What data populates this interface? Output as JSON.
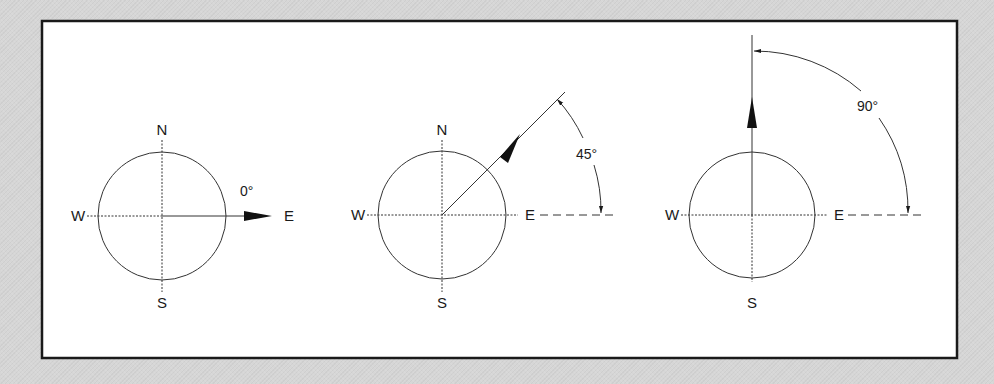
{
  "figure": {
    "frame": {
      "x": 42,
      "y": 21,
      "width": 915,
      "height": 337,
      "stroke": "#1a1a1a",
      "fill": "#ffffff"
    },
    "colors": {
      "line": "#333333",
      "text": "#1a1a1a",
      "background": "#d6d6d6"
    },
    "compass_labels": {
      "north": "N",
      "south": "S",
      "east": "E",
      "west": "W"
    },
    "panels": [
      {
        "id": "panel-0",
        "angle_label": "0°",
        "angle_deg": 0,
        "cx": 162,
        "cy": 216,
        "r": 64
      },
      {
        "id": "panel-45",
        "angle_label": "45°",
        "angle_deg": 45,
        "cx": 442,
        "cy": 215,
        "r": 64
      },
      {
        "id": "panel-90",
        "angle_label": "90°",
        "angle_deg": 90,
        "cx": 752,
        "cy": 215,
        "r": 64
      }
    ]
  }
}
